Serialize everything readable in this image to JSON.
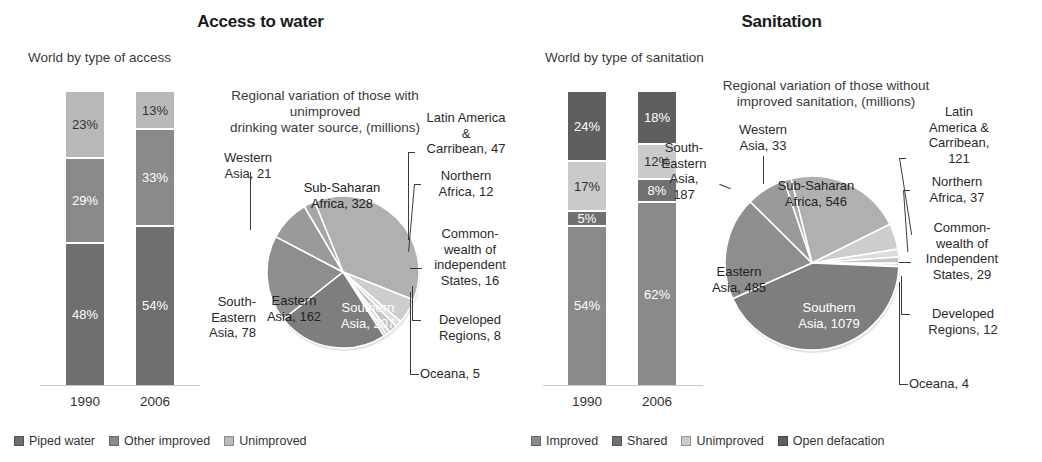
{
  "figure": {
    "palette": {
      "dark": "#6f6f6f",
      "mid": "#8a8a8a",
      "light": "#b9b9b9",
      "lighter": "#cfcfcf",
      "darkest": "#5a5a5a",
      "verydark": "#585858",
      "pale": "#d8d8d8",
      "white": "#ffffff"
    }
  },
  "water": {
    "title": "Access to water",
    "bars_subtitle": "World by type of access",
    "years": [
      "1990",
      "2006"
    ],
    "legend": [
      {
        "label": "Piped water",
        "color": "#6f6f6f"
      },
      {
        "label": "Other improved",
        "color": "#8a8a8a"
      },
      {
        "label": "Unimproved",
        "color": "#b9b9b9"
      }
    ],
    "pie_title_line1": "Regional variation of those with unimproved",
    "pie_title_line2": "drinking water source, (millions)",
    "chart_data": {
      "type": "bar",
      "title": "World by type of access",
      "xlabel": "",
      "ylabel": "Share of world population (%)",
      "ylim": [
        0,
        100
      ],
      "stacked": true,
      "categories": [
        "1990",
        "2006"
      ],
      "series": [
        {
          "name": "Piped water",
          "values": [
            48,
            54
          ],
          "labels": [
            "48%",
            "54%"
          ],
          "color": "#6f6f6f"
        },
        {
          "name": "Other improved",
          "values": [
            29,
            33
          ],
          "labels": [
            "29%",
            "33%"
          ],
          "color": "#8a8a8a"
        },
        {
          "name": "Unimproved",
          "values": [
            23,
            13
          ],
          "labels": [
            "23%",
            "13%"
          ],
          "color": "#b9b9b9"
        }
      ]
    },
    "pie_data": {
      "type": "pie",
      "title": "Regional variation of those with unimproved drinking water source, (millions)",
      "unit": "millions",
      "slices": [
        {
          "name": "Sub-Saharan Africa",
          "value": 328,
          "label": "Sub-Saharan Africa, 328",
          "color": "#b0b0b0"
        },
        {
          "name": "Latin America & Carribean",
          "value": 47,
          "label": "Latin America & Carribean, 47",
          "color": "#cdcdcd"
        },
        {
          "name": "Northern Africa",
          "value": 12,
          "label": "Northern Africa, 12",
          "color": "#dcdcdc"
        },
        {
          "name": "Commonwealth of independent States",
          "value": 16,
          "label": "Commonwealth of independent States, 16",
          "color": "#c4c4c4"
        },
        {
          "name": "Developed Regions",
          "value": 8,
          "label": "Developed Regions, 8",
          "color": "#d4d4d4"
        },
        {
          "name": "Oceana",
          "value": 5,
          "label": "Oceana, 5",
          "color": "#bfbfbf"
        },
        {
          "name": "Southern Asia",
          "value": 207,
          "label": "Southern Asia, 207",
          "color": "#7e7e7e"
        },
        {
          "name": "Eastern Asia",
          "value": 162,
          "label": "Eastern Asia, 162",
          "color": "#8e8e8e"
        },
        {
          "name": "South-Eastern Asia",
          "value": 78,
          "label": "South-Eastern Asia, 78",
          "color": "#9a9a9a"
        },
        {
          "name": "Western Asia",
          "value": 21,
          "label": "Western Asia, 21",
          "color": "#a6a6a6"
        }
      ]
    },
    "labels": {
      "sub_saharan_l1": "Sub-Saharan",
      "sub_saharan_l2": "Africa, 328",
      "southern_l1": "Southern",
      "southern_l2": "Asia, 207",
      "eastern_l1": "Eastern",
      "eastern_l2": "Asia, 162",
      "south_eastern_l1": "South-",
      "south_eastern_l2": "Eastern",
      "south_eastern_l3": "Asia, 78",
      "western_l1": "Western",
      "western_l2": "Asia, 21",
      "latin_l1": "Latin America",
      "latin_l2": "&",
      "latin_l3": "Carribean, 47",
      "northern_l1": "Northern",
      "northern_l2": "Africa, 12",
      "cis_l1": "Common-",
      "cis_l2": "wealth of",
      "cis_l3": "independent",
      "cis_l4": "States, 16",
      "developed_l1": "Developed",
      "developed_l2": "Regions, 8",
      "oceana_l1": "Oceana, 5"
    }
  },
  "sanitation": {
    "title": "Sanitation",
    "bars_subtitle": "World by type of sanitation",
    "years": [
      "1990",
      "2006"
    ],
    "legend": [
      {
        "label": "Improved",
        "color": "#8a8a8a"
      },
      {
        "label": "Shared",
        "color": "#707070"
      },
      {
        "label": "Unimproved",
        "color": "#cacaca"
      },
      {
        "label": "Open defacation",
        "color": "#5f5f5f"
      }
    ],
    "pie_title_line1": "Regional variation of those without",
    "pie_title_line2": "improved sanitation, (millions)",
    "chart_data": {
      "type": "bar",
      "title": "World by type of sanitation",
      "xlabel": "",
      "ylabel": "Share of world population (%)",
      "ylim": [
        0,
        100
      ],
      "stacked": true,
      "categories": [
        "1990",
        "2006"
      ],
      "series": [
        {
          "name": "Improved",
          "values": [
            54,
            62
          ],
          "labels": [
            "54%",
            "62%"
          ],
          "color": "#8a8a8a"
        },
        {
          "name": "Shared",
          "values": [
            5,
            8
          ],
          "labels": [
            "5%",
            "8%"
          ],
          "color": "#707070"
        },
        {
          "name": "Unimproved",
          "values": [
            17,
            12
          ],
          "labels": [
            "17%",
            "12%"
          ],
          "color": "#cacaca"
        },
        {
          "name": "Open defacation",
          "values": [
            24,
            18
          ],
          "labels": [
            "24%",
            "18%"
          ],
          "color": "#5f5f5f"
        }
      ]
    },
    "pie_data": {
      "type": "pie",
      "title": "Regional variation of those without improved sanitation, (millions)",
      "unit": "millions",
      "slices": [
        {
          "name": "Sub-Saharan Africa",
          "value": 546,
          "label": "Sub-Saharan Africa, 546",
          "color": "#b0b0b0"
        },
        {
          "name": "Latin America & Carribean",
          "value": 121,
          "label": "Latin America & Carribean, 121",
          "color": "#cdcdcd"
        },
        {
          "name": "Northern Africa",
          "value": 37,
          "label": "Northern Africa, 37",
          "color": "#dcdcdc"
        },
        {
          "name": "Commonwealth of Independent States",
          "value": 29,
          "label": "Commonwealth of Independent States, 29",
          "color": "#c4c4c4"
        },
        {
          "name": "Developed Regions",
          "value": 12,
          "label": "Developed Regions, 12",
          "color": "#d4d4d4"
        },
        {
          "name": "Oceana",
          "value": 4,
          "label": "Oceana, 4",
          "color": "#bfbfbf"
        },
        {
          "name": "Southern Asia",
          "value": 1079,
          "label": "Southern Asia, 1079",
          "color": "#7e7e7e"
        },
        {
          "name": "Eastern Asia",
          "value": 485,
          "label": "Eastern Asia, 485",
          "color": "#8e8e8e"
        },
        {
          "name": "South-Eastern Asia",
          "value": 187,
          "label": "South-Eastern Asia, 187",
          "color": "#9a9a9a"
        },
        {
          "name": "Western Asia",
          "value": 33,
          "label": "Western Asia, 33",
          "color": "#a6a6a6"
        }
      ]
    },
    "labels": {
      "sub_saharan_l1": "Sub-Saharan",
      "sub_saharan_l2": "Africa, 546",
      "southern_l1": "Southern",
      "southern_l2": "Asia, 1079",
      "eastern_l1": "Eastern",
      "eastern_l2": "Asia, 485",
      "south_eastern_l1": "South-",
      "south_eastern_l2": "Eastern",
      "south_eastern_l3": "Asia,",
      "south_eastern_l4": "187",
      "western_l1": "Western",
      "western_l2": "Asia, 33",
      "latin_l1": "Latin",
      "latin_l2": "America &",
      "latin_l3": "Carribean,",
      "latin_l4": "121",
      "northern_l1": "Northern",
      "northern_l2": "Africa, 37",
      "cis_l1": "Common-",
      "cis_l2": "wealth of",
      "cis_l3": "Independent",
      "cis_l4": "States, 29",
      "developed_l1": "Developed",
      "developed_l2": "Regions, 12",
      "oceana_l1": "Oceana, 4"
    }
  }
}
